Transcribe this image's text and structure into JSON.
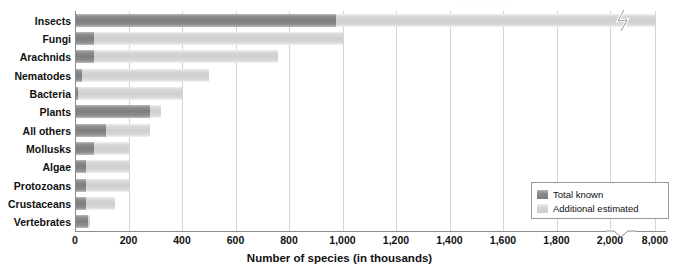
{
  "top_remnant": "· · · · · · · · · ·",
  "legend": {
    "items": [
      {
        "label": "Total known",
        "key": "known",
        "color": "#7d7d7d"
      },
      {
        "label": "Additional estimated",
        "key": "estimated",
        "color": "#cfcfcf"
      }
    ]
  },
  "chart_data": {
    "type": "bar",
    "orientation": "horizontal",
    "stacked": true,
    "title": "",
    "xlabel": "Number of species (in thousands)",
    "ylabel": "",
    "categories": [
      "Insects",
      "Fungi",
      "Arachnids",
      "Nematodes",
      "Bacteria",
      "Plants",
      "All others",
      "Mollusks",
      "Algae",
      "Protozoans",
      "Crustaceans",
      "Vertebrates"
    ],
    "series": [
      {
        "name": "Total known",
        "color": "#7d7d7d",
        "values": [
          975,
          70,
          70,
          25,
          10,
          280,
          115,
          70,
          40,
          40,
          40,
          50
        ]
      },
      {
        "name": "Additional estimated",
        "color": "#cfcfcf",
        "note": "light segment is drawn to the total estimated value",
        "totals": [
          8000,
          1000,
          760,
          500,
          400,
          320,
          280,
          200,
          200,
          200,
          150,
          55
        ]
      }
    ],
    "xticks": [
      {
        "label": "0",
        "value": 0
      },
      {
        "label": "200",
        "value": 200
      },
      {
        "label": "400",
        "value": 400
      },
      {
        "label": "600",
        "value": 600
      },
      {
        "label": "800",
        "value": 800
      },
      {
        "label": "1,000",
        "value": 1000
      },
      {
        "label": "1,200",
        "value": 1200
      },
      {
        "label": "1,400",
        "value": 1400
      },
      {
        "label": "1,600",
        "value": 1600
      },
      {
        "label": "1,800",
        "value": 1800
      },
      {
        "label": "2,000",
        "value": 2000
      },
      {
        "label": "8,000",
        "value": 8000
      }
    ],
    "xlim": [
      0,
      2000
    ],
    "axis_break": {
      "after": 2000,
      "resumes_at": 8000,
      "style": "zigzag"
    },
    "grid": "vertical",
    "legend_position": "bottom-right"
  }
}
